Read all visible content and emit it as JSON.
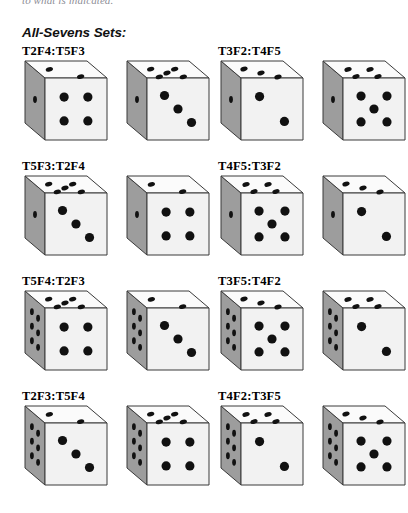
{
  "header": {
    "cut_off_line": "to what is indicated.",
    "section_title": "All-Sevens Sets:"
  },
  "sets": [
    {
      "label": "T2F4:T5F3",
      "dice": [
        {
          "top": 2,
          "front": 4,
          "left": 1
        },
        {
          "top": 5,
          "front": 3,
          "left": 1
        }
      ]
    },
    {
      "label": "T3F2:T4F5",
      "dice": [
        {
          "top": 3,
          "front": 2,
          "left": 1
        },
        {
          "top": 4,
          "front": 5,
          "left": 1
        }
      ]
    },
    {
      "label": "T5F3:T2F4",
      "dice": [
        {
          "top": 5,
          "front": 3,
          "left": 1
        },
        {
          "top": 2,
          "front": 4,
          "left": 1
        }
      ]
    },
    {
      "label": "T4F5:T3F2",
      "dice": [
        {
          "top": 4,
          "front": 5,
          "left": 1
        },
        {
          "top": 3,
          "front": 2,
          "left": 1
        }
      ]
    },
    {
      "label": "T5F4:T2F3",
      "dice": [
        {
          "top": 5,
          "front": 4,
          "left": 6
        },
        {
          "top": 2,
          "front": 3,
          "left": 6
        }
      ]
    },
    {
      "label": "T3F5:T4F2",
      "dice": [
        {
          "top": 3,
          "front": 5,
          "left": 6
        },
        {
          "top": 4,
          "front": 2,
          "left": 6
        }
      ]
    },
    {
      "label": "T2F3:T5F4",
      "dice": [
        {
          "top": 2,
          "front": 3,
          "left": 6
        },
        {
          "top": 5,
          "front": 4,
          "left": 6
        }
      ]
    },
    {
      "label": "T4F2:T3F5",
      "dice": [
        {
          "top": 4,
          "front": 2,
          "left": 6
        },
        {
          "top": 3,
          "front": 5,
          "left": 6
        }
      ]
    }
  ],
  "style": {
    "face_front": "#f2f2f2",
    "face_top": "#fbfbfb",
    "face_left": "#9d9d9d",
    "pip_color": "#111111",
    "edge_color": "#3a3a3a",
    "background": "#ffffff"
  }
}
